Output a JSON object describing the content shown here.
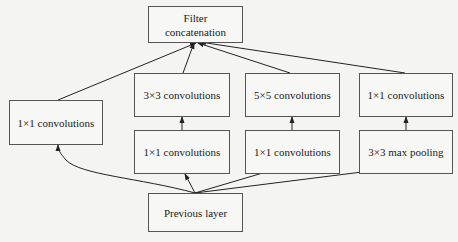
{
  "diagram": {
    "nodes": {
      "concat": {
        "label": "Filter\nconcatenation"
      },
      "conv1x1_a": {
        "label": "1×1 convolutions"
      },
      "conv3x3": {
        "label": "3×3 convolutions"
      },
      "conv1x1_b": {
        "label": "1×1 convolutions"
      },
      "conv5x5": {
        "label": "5×5 convolutions"
      },
      "conv1x1_c": {
        "label": "1×1 convolutions"
      },
      "conv1x1_d": {
        "label": "1×1 convolutions"
      },
      "maxpool3x3": {
        "label": "3×3 max pooling"
      },
      "previous": {
        "label": "Previous layer"
      }
    },
    "edges": [
      {
        "from": "previous",
        "to": "conv1x1_a"
      },
      {
        "from": "previous",
        "to": "conv1x1_b"
      },
      {
        "from": "previous",
        "to": "conv1x1_c"
      },
      {
        "from": "previous",
        "to": "maxpool3x3"
      },
      {
        "from": "conv1x1_b",
        "to": "conv3x3"
      },
      {
        "from": "conv1x1_c",
        "to": "conv5x5"
      },
      {
        "from": "maxpool3x3",
        "to": "conv1x1_d"
      },
      {
        "from": "conv1x1_a",
        "to": "concat"
      },
      {
        "from": "conv3x3",
        "to": "concat"
      },
      {
        "from": "conv5x5",
        "to": "concat"
      },
      {
        "from": "conv1x1_d",
        "to": "concat"
      }
    ],
    "colors": {
      "line": "#222222",
      "border": "#555555",
      "background": "#f4f4f2"
    }
  }
}
